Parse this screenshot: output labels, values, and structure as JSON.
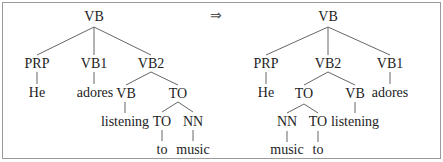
{
  "arrow": "⇒",
  "left_tree": {
    "root": "VB",
    "prp": "PRP",
    "he": "He",
    "vb1": "VB1",
    "adores": "adores",
    "vb2": "VB2",
    "vb": "VB",
    "listening": "listening",
    "to_phrase": "TO",
    "to": "TO",
    "to_word": "to",
    "nn": "NN",
    "music": "music"
  },
  "right_tree": {
    "root": "VB",
    "prp": "PRP",
    "he": "He",
    "vb2": "VB2",
    "to_phrase": "TO",
    "nn": "NN",
    "music": "music",
    "to": "TO",
    "to_word": "to",
    "vb": "VB",
    "listening": "listening",
    "vb1": "VB1",
    "adores": "adores"
  }
}
